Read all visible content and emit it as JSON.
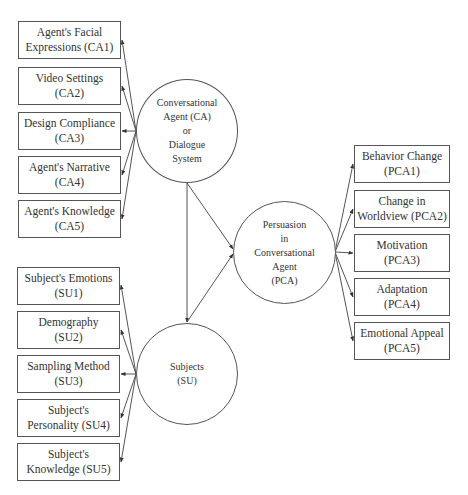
{
  "diagram": {
    "type": "conceptual-model",
    "nodes": {
      "ca": {
        "id": "CA",
        "label": "Conversational\nAgent (CA)\nor\nDialogue\nSystem"
      },
      "su": {
        "id": "SU",
        "label": "Subjects\n(SU)"
      },
      "pca": {
        "id": "PCA",
        "label": "Persuasion\nin\nConversational\nAgent\n(PCA)"
      }
    },
    "ca_factors": [
      {
        "id": "CA1",
        "label": "Agent's Facial\nExpressions (CA1)"
      },
      {
        "id": "CA2",
        "label": "Video Settings\n(CA2)"
      },
      {
        "id": "CA3",
        "label": "Design Compliance\n(CA3)"
      },
      {
        "id": "CA4",
        "label": "Agent's Narrative\n(CA4)"
      },
      {
        "id": "CA5",
        "label": "Agent's Knowledge\n(CA5)"
      }
    ],
    "su_factors": [
      {
        "id": "SU1",
        "label": "Subject's Emotions\n(SU1)"
      },
      {
        "id": "SU2",
        "label": "Demography\n(SU2)"
      },
      {
        "id": "SU3",
        "label": "Sampling Method\n(SU3)"
      },
      {
        "id": "SU4",
        "label": "Subject's\nPersonality (SU4)"
      },
      {
        "id": "SU5",
        "label": "Subject's\nKnowledge (SU5)"
      }
    ],
    "pca_factors": [
      {
        "id": "PCA1",
        "label": "Behavior Change\n(PCA1)"
      },
      {
        "id": "PCA2",
        "label": "Change in\nWorldview (PCA2)"
      },
      {
        "id": "PCA3",
        "label": "Motivation\n(PCA3)"
      },
      {
        "id": "PCA4",
        "label": "Adaptation\n(PCA4)"
      },
      {
        "id": "PCA5",
        "label": "Emotional Appeal\n(PCA5)"
      }
    ],
    "edges": [
      {
        "from": "CA",
        "to": "CA1"
      },
      {
        "from": "CA",
        "to": "CA2"
      },
      {
        "from": "CA",
        "to": "CA3"
      },
      {
        "from": "CA",
        "to": "CA4"
      },
      {
        "from": "CA",
        "to": "CA5"
      },
      {
        "from": "SU",
        "to": "SU1"
      },
      {
        "from": "SU",
        "to": "SU2"
      },
      {
        "from": "SU",
        "to": "SU3"
      },
      {
        "from": "SU",
        "to": "SU4"
      },
      {
        "from": "SU",
        "to": "SU5"
      },
      {
        "from": "PCA",
        "to": "PCA1"
      },
      {
        "from": "PCA",
        "to": "PCA2"
      },
      {
        "from": "PCA",
        "to": "PCA3"
      },
      {
        "from": "PCA",
        "to": "PCA4"
      },
      {
        "from": "PCA",
        "to": "PCA5"
      },
      {
        "from": "CA",
        "to": "SU"
      },
      {
        "from": "CA",
        "to": "PCA"
      },
      {
        "from": "SU",
        "to": "PCA"
      }
    ],
    "colors": {
      "stroke": "#555555",
      "text": "#333333",
      "background": "#ffffff"
    }
  }
}
